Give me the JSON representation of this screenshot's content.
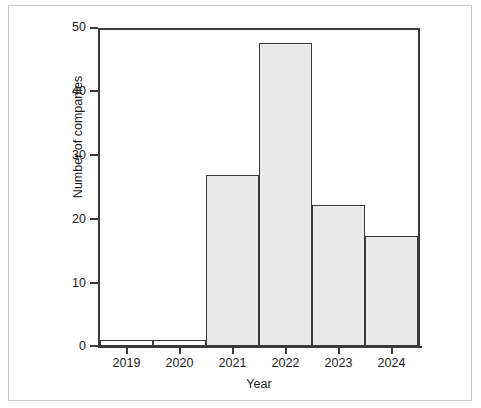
{
  "chart_data": {
    "type": "bar",
    "title": "",
    "subtitle": "",
    "xlabel": "Year",
    "ylabel": "Number of companies",
    "categories": [
      "2019",
      "2020",
      "2021",
      "2022",
      "2023",
      "2024"
    ],
    "values": [
      1,
      1,
      28,
      49.5,
      23,
      18
    ],
    "series": [
      {
        "name": "Number of companies",
        "values": [
          1,
          1,
          28,
          49.5,
          23,
          18
        ]
      }
    ],
    "xlim": [
      0,
      6
    ],
    "ylim": [
      0,
      52
    ],
    "y_ticks": [
      0,
      10,
      20,
      30,
      40,
      50
    ],
    "y_tick_labels": [
      "0",
      "10",
      "20",
      "30",
      "40",
      "50"
    ],
    "x_tick_labels": [
      "2019",
      "2020",
      "2021",
      "2022",
      "2023",
      "2024"
    ],
    "grid": false,
    "legend": false,
    "legend_position": "none",
    "annotations": [],
    "bar_style": {
      "fill_color": "#e9e9e9",
      "edge_color": "#3a3a3a",
      "gap": 0
    },
    "colors": {
      "background": "#ffffff",
      "axis": "#3a3a3a",
      "text": "#1c1c1c",
      "page_border": "#c9c9c9"
    }
  }
}
